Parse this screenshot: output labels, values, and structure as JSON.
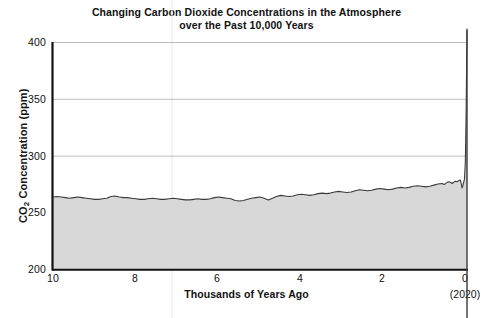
{
  "chart_data": {
    "type": "area",
    "title": "Changing Carbon Dioxide Concentrations in the Atmosphere\nover the Past 10,000 Years",
    "xlabel": "Thousands of Years Ago",
    "ylabel": "CO₂ Concentration (ppm)",
    "x_axis_note": "(2020)",
    "xlim": [
      10,
      0
    ],
    "ylim": [
      200,
      400
    ],
    "xticks": [
      10,
      8,
      6,
      4,
      2,
      0
    ],
    "xtick_labels": [
      "10",
      "8",
      "6",
      "4",
      "2",
      "0"
    ],
    "yticks": [
      200,
      250,
      300,
      350,
      400
    ],
    "ytick_labels": [
      "200",
      "250",
      "300",
      "350",
      "400"
    ],
    "grid": "horizontal",
    "legend": "none",
    "x_direction": "reversed",
    "series": [
      {
        "name": "CO2 Concentration",
        "units": "ppm",
        "x_units": "thousands of years ago",
        "line_color": "#3a3a3a",
        "fill_color": "#d8d8d8",
        "x": [
          10.0,
          9.9,
          9.8,
          9.7,
          9.6,
          9.5,
          9.4,
          9.3,
          9.2,
          9.1,
          9.0,
          8.9,
          8.8,
          8.7,
          8.6,
          8.5,
          8.4,
          8.3,
          8.2,
          8.1,
          8.0,
          7.9,
          7.8,
          7.7,
          7.6,
          7.5,
          7.4,
          7.3,
          7.2,
          7.1,
          7.0,
          6.9,
          6.8,
          6.7,
          6.6,
          6.5,
          6.4,
          6.3,
          6.2,
          6.1,
          6.0,
          5.9,
          5.8,
          5.7,
          5.6,
          5.5,
          5.4,
          5.3,
          5.2,
          5.1,
          5.0,
          4.9,
          4.8,
          4.7,
          4.6,
          4.5,
          4.4,
          4.3,
          4.2,
          4.1,
          4.0,
          3.9,
          3.8,
          3.7,
          3.6,
          3.5,
          3.4,
          3.3,
          3.2,
          3.1,
          3.0,
          2.9,
          2.8,
          2.7,
          2.6,
          2.5,
          2.4,
          2.3,
          2.2,
          2.1,
          2.0,
          1.9,
          1.8,
          1.7,
          1.6,
          1.5,
          1.4,
          1.3,
          1.2,
          1.1,
          1.0,
          0.9,
          0.8,
          0.7,
          0.6,
          0.55,
          0.5,
          0.45,
          0.4,
          0.36,
          0.32,
          0.28,
          0.24,
          0.2,
          0.16,
          0.14,
          0.12,
          0.1,
          0.08,
          0.06,
          0.04,
          0.02,
          0.0
        ],
        "y": [
          264.0,
          264.5,
          264.0,
          263.5,
          263.0,
          263.5,
          264.0,
          263.5,
          263.0,
          262.5,
          262.0,
          262.0,
          262.5,
          263.0,
          264.5,
          265.0,
          264.0,
          263.5,
          263.5,
          263.0,
          262.5,
          262.0,
          262.0,
          262.5,
          263.0,
          262.5,
          262.0,
          262.0,
          262.5,
          263.0,
          262.5,
          262.0,
          261.5,
          261.5,
          262.0,
          262.5,
          262.0,
          262.0,
          262.5,
          263.5,
          264.0,
          263.5,
          263.0,
          262.5,
          261.0,
          260.5,
          261.0,
          262.0,
          263.0,
          263.5,
          264.0,
          263.0,
          261.5,
          263.0,
          264.5,
          265.5,
          265.0,
          264.5,
          265.0,
          266.0,
          266.5,
          266.0,
          265.5,
          266.0,
          267.0,
          267.5,
          267.0,
          267.5,
          268.5,
          269.0,
          268.5,
          268.0,
          268.5,
          269.5,
          270.5,
          270.0,
          269.5,
          270.0,
          271.0,
          271.5,
          271.0,
          270.5,
          271.0,
          272.0,
          272.5,
          272.0,
          272.5,
          273.5,
          274.0,
          273.5,
          273.0,
          273.5,
          274.5,
          275.5,
          276.0,
          275.0,
          276.5,
          277.5,
          277.0,
          276.0,
          277.0,
          278.0,
          277.5,
          278.5,
          279.0,
          276.0,
          272.0,
          274.0,
          277.0,
          280.0,
          295.0,
          340.0,
          412.0
        ]
      }
    ],
    "annotations": [
      {
        "text": "(2020)",
        "at_x": 0,
        "position": "below-axis"
      }
    ]
  },
  "colors": {
    "line": "#3a3a3a",
    "fill": "#d8d8d8",
    "grid": "#b5b5b5",
    "axis": "#111111",
    "background": "#ffffff"
  }
}
